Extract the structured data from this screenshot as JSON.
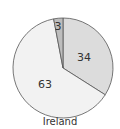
{
  "chart_data": {
    "type": "pie",
    "title": "Ireland",
    "categories": [
      "Slice A",
      "Slice B",
      "Slice C"
    ],
    "values": [
      34,
      63,
      3
    ],
    "colors": [
      "#dcdcdc",
      "#f2f2f2",
      "#bdbdbd"
    ],
    "start": "top, clockwise",
    "legend": "none"
  },
  "labels": {
    "a": "34",
    "b": "63",
    "c": "3"
  },
  "caption": "Ireland"
}
